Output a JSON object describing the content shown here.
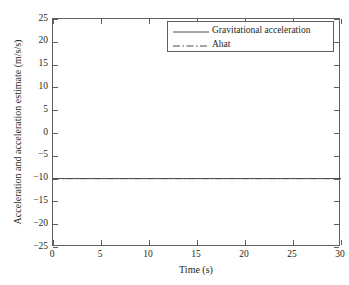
{
  "chart_data": {
    "type": "line",
    "title": "",
    "xlabel": "Time (s)",
    "ylabel": "Acceleration and acceleration estimate (m/s/s)",
    "xlim": [
      0,
      30
    ],
    "ylim": [
      -25,
      25
    ],
    "xticks": [
      0,
      5,
      10,
      15,
      20,
      25,
      30
    ],
    "yticks": [
      25,
      20,
      15,
      10,
      5,
      0,
      -5,
      -10,
      -15,
      -20,
      -25
    ],
    "xtick_labels": [
      "0",
      "5",
      "10",
      "15",
      "20",
      "25",
      "30"
    ],
    "ytick_labels": [
      "25",
      "20",
      "15",
      "10",
      "5",
      "0",
      "−5",
      "−10",
      "−15",
      "−20",
      "−25"
    ],
    "grid": false,
    "legend_position": "top-right",
    "line_color": "#4a4a4a",
    "axis_color": "#5f5f5f",
    "background": "#ffffff",
    "series": [
      {
        "name": "Gravitational acceleration",
        "style": "solid",
        "x": [
          0,
          30
        ],
        "values": [
          -10,
          -10
        ]
      },
      {
        "name": "Ahat",
        "style": "dash-dot",
        "x": [
          0,
          30
        ],
        "values": [
          -10,
          -10
        ]
      }
    ],
    "annotations": []
  },
  "legend": {
    "items": [
      {
        "label": "Gravitational acceleration",
        "style": "solid"
      },
      {
        "label": "Ahat",
        "style": "dash-dot"
      }
    ]
  }
}
